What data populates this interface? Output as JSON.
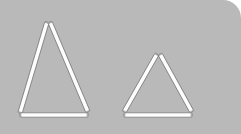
{
  "scene": {
    "title": "Matchstick triangles puzzle image",
    "background_color": "#b9b9b9",
    "outside_color": "#ffffff",
    "panel": {
      "width": 241,
      "height": 134,
      "corner_radius_top_right": 18
    },
    "stick_style": {
      "fill_color": "#fdfdfd",
      "outline_color": "#6f6f6f",
      "thickness": 4.4
    },
    "figures": [
      {
        "name": "large-triangle",
        "label": "Large triangle",
        "stick_count": 3,
        "apex": {
          "x": 48,
          "y": 22
        },
        "bottom_left": {
          "x": 20,
          "y": 113
        },
        "bottom_right": {
          "x": 88,
          "y": 114
        },
        "sticks": [
          {
            "name": "left-side-stick",
            "x1": 47,
            "y1": 22,
            "x2": 20,
            "y2": 113
          },
          {
            "name": "right-side-stick",
            "x1": 50,
            "y1": 22,
            "x2": 88,
            "y2": 112
          },
          {
            "name": "base-stick",
            "x1": 20,
            "y1": 115,
            "x2": 88,
            "y2": 115
          }
        ]
      },
      {
        "name": "small-triangle",
        "label": "Small triangle",
        "stick_count": 3,
        "apex": {
          "x": 158,
          "y": 54
        },
        "bottom_left": {
          "x": 124,
          "y": 113
        },
        "bottom_right": {
          "x": 192,
          "y": 114
        },
        "sticks": [
          {
            "name": "left-side-stick",
            "x1": 157,
            "y1": 54,
            "x2": 124,
            "y2": 112
          },
          {
            "name": "right-side-stick",
            "x1": 160,
            "y1": 54,
            "x2": 192,
            "y2": 112
          },
          {
            "name": "base-stick",
            "x1": 124,
            "y1": 115,
            "x2": 192,
            "y2": 115
          }
        ]
      }
    ]
  }
}
